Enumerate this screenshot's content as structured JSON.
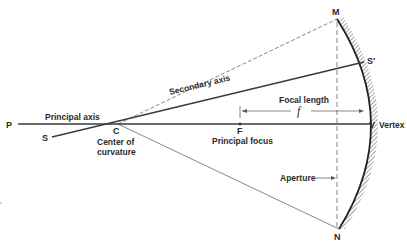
{
  "diagram": {
    "points": {
      "P": "P",
      "S": "S",
      "C": "C",
      "F": "F",
      "V": "V",
      "M": "M",
      "N": "N",
      "S_prime": "S′"
    },
    "labels": {
      "principal_axis": "Principal axis",
      "secondary_axis": "Secondary axis",
      "center_line1": "Center of",
      "center_line2": "curvature",
      "principal_focus": "Principal focus",
      "focal_length": "Focal length",
      "focal_symbol": "f",
      "vertex": "Vertex",
      "aperture": "Aperture"
    },
    "colors": {
      "line": "#3a3a3a",
      "dashed": "#555555",
      "hatch": "#6a6a6a"
    }
  }
}
